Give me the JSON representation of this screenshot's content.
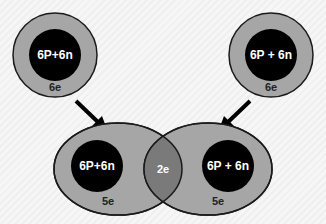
{
  "colors": {
    "background": "#f4f4f4",
    "shell": "#a6a6a6",
    "nucleus": "#000000",
    "overlap": "#7a7a7a",
    "outline": "#1a1a1a",
    "arrow": "#000000"
  },
  "atoms": [
    {
      "nucleus_label": "6P+6n",
      "electron_label": "6e"
    },
    {
      "nucleus_label": "6P + 6n",
      "electron_label": "6e"
    }
  ],
  "molecule": {
    "left": {
      "nucleus_label": "6P+6n",
      "electron_label": "5e"
    },
    "right": {
      "nucleus_label": "6P + 6n",
      "electron_label": "5e"
    },
    "shared_label": "2e"
  }
}
